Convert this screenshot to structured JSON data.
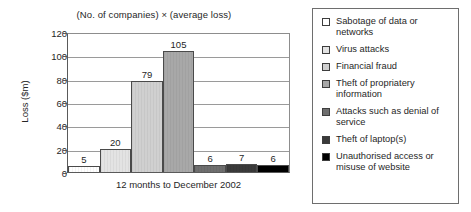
{
  "chart_data": {
    "type": "bar",
    "title": "(No. of companies) × (average loss)",
    "xlabel": "12 months to December 2002",
    "ylabel": "Loss ($m)",
    "ylim": [
      0,
      120
    ],
    "yticks": [
      0,
      20,
      40,
      60,
      80,
      100,
      120
    ],
    "grid": true,
    "legend_position": "right",
    "categories": [
      "Sabotage of data or networks",
      "Virus attacks",
      "Financial fraud",
      "Theft of propriatery information",
      "Attacks such as denial of service",
      "Theft of laptop(s)",
      "Unauthorised access or misuse of website"
    ],
    "values": [
      5,
      20,
      79,
      105,
      6,
      7,
      6
    ],
    "colors": [
      "#ffffff",
      "#e3e3e3",
      "#d0d0d0",
      "#a8a8a8",
      "#6e6e6e",
      "#3a3a3a",
      "#000000"
    ]
  },
  "chart": {
    "title": "(No. of companies) × (average loss)",
    "y_axis_title": "Loss ($m)",
    "x_axis_label": "12 months to December 2002",
    "y_ticks": [
      "120",
      "100",
      "80",
      "60",
      "40",
      "20",
      "0"
    ],
    "bars": [
      {
        "label": "5",
        "value": 5
      },
      {
        "label": "20",
        "value": 20
      },
      {
        "label": "79",
        "value": 79
      },
      {
        "label": "105",
        "value": 105
      },
      {
        "label": "6",
        "value": 6
      },
      {
        "label": "7",
        "value": 7
      },
      {
        "label": "6",
        "value": 6
      }
    ]
  },
  "legend": {
    "items": [
      {
        "label": "Sabotage of data or networks",
        "color": "#ffffff"
      },
      {
        "label": "Virus attacks",
        "color": "#e3e3e3"
      },
      {
        "label": "Financial fraud",
        "color": "#d0d0d0"
      },
      {
        "label": "Theft of propriatery information",
        "color": "#a8a8a8"
      },
      {
        "label": "Attacks such as denial of service",
        "color": "#6e6e6e"
      },
      {
        "label": "Theft of laptop(s)",
        "color": "#3a3a3a"
      },
      {
        "label": "Unauthorised access or misuse of website",
        "color": "#000000"
      }
    ]
  }
}
